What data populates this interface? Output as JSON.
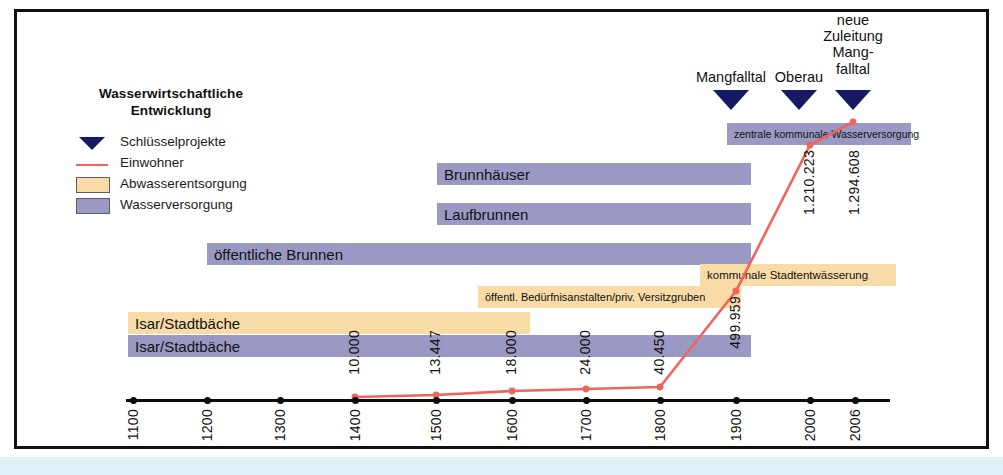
{
  "figure": {
    "frame_color": "#111111",
    "background": "#ffffff"
  },
  "legend": {
    "title_line1": "Wasserwirtschaftliche",
    "title_line2": "Entwicklung",
    "items": [
      {
        "key": "triangle",
        "label": "Schlüsselprojekte",
        "color": "#161a63"
      },
      {
        "key": "line",
        "label": "Einwohner",
        "color": "#f0645c"
      },
      {
        "key": "swatch",
        "label": "Abwasserentsorgung",
        "color": "#f8dba6"
      },
      {
        "key": "swatch",
        "label": "Wasserversorgung",
        "color": "#9a99c4"
      }
    ]
  },
  "colors": {
    "wasserversorgung": "#9a99c4",
    "abwasserentsorgung": "#f8dba6",
    "einwohner_line": "#f0645c",
    "marker": "#161a63",
    "axis": "#0d0d0d"
  },
  "key_projects": [
    {
      "label": "Mangfalltal",
      "year": 1873,
      "x": 731
    },
    {
      "label": "Oberau",
      "year": 1965,
      "x": 799
    },
    {
      "label": "neue\nZuleitung\nMang-\nfalltal",
      "year": 2006,
      "x": 853,
      "lines": [
        "neue",
        "Zuleitung",
        "Mang-",
        "falltal"
      ]
    }
  ],
  "bars": [
    {
      "label": "zentrale kommunale Wasserversorgung",
      "category": "Wasserversorgung",
      "x": 727,
      "w": 184,
      "y": 123,
      "font": 10.5
    },
    {
      "label": "Brunnhäuser",
      "category": "Wasserversorgung",
      "x": 437,
      "w": 314,
      "y": 163,
      "font": 15
    },
    {
      "label": "Laufbrunnen",
      "category": "Wasserversorgung",
      "x": 437,
      "w": 314,
      "y": 203,
      "font": 15
    },
    {
      "label": "öffentliche Brunnen",
      "category": "Wasserversorgung",
      "x": 207,
      "w": 544,
      "y": 243,
      "font": 15
    },
    {
      "label": "kommunale Stadtentwässerung",
      "category": "Abwasserentsorgung",
      "x": 700,
      "w": 196,
      "y": 264,
      "font": 11.5
    },
    {
      "label": "öffentl. Bedürfnisanstalten/priv. Versitzgruben",
      "category": "Abwasserentsorgung",
      "x": 478,
      "w": 263,
      "y": 286,
      "font": 11
    },
    {
      "label": "Isar/Stadtbäche",
      "category": "Abwasserentsorgung",
      "x": 128,
      "w": 402,
      "y": 312,
      "font": 15
    },
    {
      "label": "Isar/Stadtbäche",
      "category": "Wasserversorgung",
      "x": 128,
      "w": 623,
      "y": 335,
      "font": 15
    }
  ],
  "axis": {
    "ticks": [
      {
        "label": "1100",
        "x": 133
      },
      {
        "label": "1200",
        "x": 207
      },
      {
        "label": "1300",
        "x": 280
      },
      {
        "label": "1400",
        "x": 355
      },
      {
        "label": "1500",
        "x": 436
      },
      {
        "label": "1600",
        "x": 512
      },
      {
        "label": "1700",
        "x": 586
      },
      {
        "label": "1800",
        "x": 660
      },
      {
        "label": "1900",
        "x": 736
      },
      {
        "label": "2000",
        "x": 810
      },
      {
        "label": "2006",
        "x": 855
      }
    ],
    "line_y": 399,
    "left": 126,
    "right": 890
  },
  "chart_data": {
    "type": "line",
    "title": "Wasserwirtschaftliche Entwicklung",
    "xlabel": "",
    "ylabel": "Einwohner",
    "series": [
      {
        "name": "Einwohner",
        "color": "#f0645c",
        "points": [
          {
            "year": 1400,
            "value": 10000,
            "value_label": "10.000",
            "px": 355,
            "py": 397,
            "lab_x": 346,
            "lab_y": 330
          },
          {
            "year": 1500,
            "value": 13447,
            "value_label": "13.447",
            "px": 436,
            "py": 395,
            "lab_x": 427,
            "lab_y": 330
          },
          {
            "year": 1600,
            "value": 18000,
            "value_label": "18.000",
            "px": 512,
            "py": 391,
            "lab_x": 503,
            "lab_y": 330
          },
          {
            "year": 1700,
            "value": 24000,
            "value_label": "24.000",
            "px": 586,
            "py": 389,
            "lab_x": 577,
            "lab_y": 330
          },
          {
            "year": 1800,
            "value": 40450,
            "value_label": "40.450",
            "px": 660,
            "py": 387,
            "lab_x": 651,
            "lab_y": 330
          },
          {
            "year": 1900,
            "value": 499959,
            "value_label": "499.959",
            "px": 736,
            "py": 291,
            "lab_x": 727,
            "lab_y": 296
          },
          {
            "year": 2000,
            "value": 1210223,
            "value_label": "1.210.223",
            "px": 810,
            "py": 145,
            "lab_x": 801,
            "lab_y": 150
          },
          {
            "year": 2006,
            "value": 1294608,
            "value_label": "1.294.608",
            "px": 853,
            "py": 122,
            "lab_x": 846,
            "lab_y": 150
          }
        ]
      }
    ],
    "legend_position": "top-left",
    "grid": false
  }
}
